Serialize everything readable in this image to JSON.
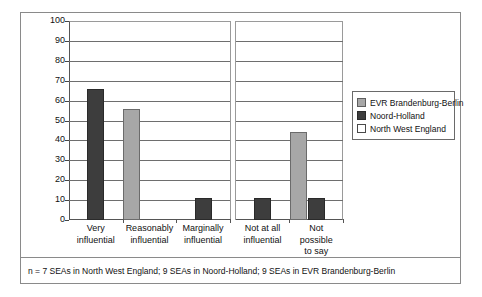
{
  "chart_data": {
    "type": "bar",
    "title": "",
    "xlabel": "",
    "ylabel": "% of all responses",
    "ylim": [
      0,
      100
    ],
    "ytick_step": 10,
    "yticks": [
      100,
      90,
      80,
      70,
      60,
      50,
      40,
      30,
      20,
      10,
      0
    ],
    "grid": true,
    "legend_position": "right",
    "categories": [
      "Very influential",
      "Reasonably influential",
      "Marginally influential",
      "Not at all influential",
      "Not possible to say"
    ],
    "category_lines": [
      [
        "Very",
        "influential"
      ],
      [
        "Reasonably",
        "influential"
      ],
      [
        "Marginally",
        "influential"
      ],
      [
        "Not at all",
        "influential"
      ],
      [
        "Not",
        "possible",
        "to say"
      ]
    ],
    "series": [
      {
        "name": "EVR Brandenburg-Berlin",
        "color": "#a7a7a7",
        "values": [
          0,
          56,
          0,
          0,
          44
        ]
      },
      {
        "name": "Noord-Holland",
        "color": "#3d3d3d",
        "values": [
          66,
          0,
          11,
          11,
          11
        ]
      },
      {
        "name": "North West England",
        "color": "#ffffff",
        "values": [
          0,
          0,
          0,
          0,
          0
        ]
      }
    ],
    "panel_break_after_category": 3
  },
  "legend": {
    "items": [
      {
        "label": "EVR Brandenburg-Berlin",
        "swatch": "evr"
      },
      {
        "label": "Noord-Holland",
        "swatch": "noord"
      },
      {
        "label": "North West England",
        "swatch": "nwe"
      }
    ]
  },
  "footnote": {
    "text": "n = 7 SEAs in North West England; 9 SEAs in Noord-Holland; 9 SEAs in EVR Brandenburg-Berlin"
  },
  "axis": {
    "y_title": "% of all responses"
  }
}
